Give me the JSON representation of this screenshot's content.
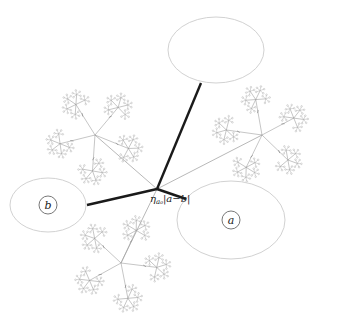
{
  "diagram": {
    "hub": {
      "x": 157,
      "y": 189,
      "label_main": "η",
      "label_sub": "a₀",
      "label_rest": "|a−b|",
      "label_x": 150,
      "label_y": 202
    },
    "ellipses": [
      {
        "id": "top",
        "cx": 216,
        "cy": 50,
        "rx": 48,
        "ry": 33,
        "label": "",
        "attach_x": 201,
        "attach_y": 83
      },
      {
        "id": "b",
        "cx": 48,
        "cy": 205,
        "rx": 38,
        "ry": 27,
        "label": "b",
        "circle_r": 9,
        "attach_x": 87,
        "attach_y": 205
      },
      {
        "id": "a",
        "cx": 231,
        "cy": 220,
        "rx": 54,
        "ry": 39,
        "label": "a",
        "circle_r": 9,
        "attach_x": 186,
        "attach_y": 199
      }
    ],
    "trees": [
      {
        "id": "upper-left",
        "cx": 95,
        "cy": 135,
        "start_angle": -50,
        "branch_len": 36,
        "sub_len": 10,
        "leaf_len": 4.2
      },
      {
        "id": "right",
        "cx": 262,
        "cy": 135,
        "start_angle": -100,
        "branch_len": 36,
        "sub_len": 10,
        "leaf_len": 4.2
      },
      {
        "id": "bottom",
        "cx": 121,
        "cy": 263,
        "start_angle": -65,
        "branch_len": 36,
        "sub_len": 10,
        "leaf_len": 4.2
      }
    ],
    "branching": {
      "sub_branches": 5,
      "leaf_branches": 5,
      "leaf_spokes": 5
    },
    "colors": {
      "thick_edge": "#1a1a1a",
      "thin_edge": "#9a9a9a",
      "ellipse": "#d2d2d2",
      "tree": "#8c8c8c"
    }
  }
}
